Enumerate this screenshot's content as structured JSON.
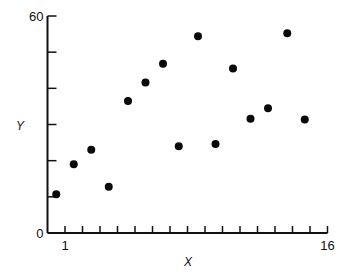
{
  "chart_data": {
    "type": "scatter",
    "title": "",
    "xlabel": "X",
    "ylabel": "Y",
    "xlim": [
      0,
      16
    ],
    "ylim": [
      0,
      60
    ],
    "x_tick_count": 16,
    "y_tick_step": 10,
    "x_tick_labels": [
      {
        "value": 1,
        "label": "1"
      },
      {
        "value": 16,
        "label": "16"
      }
    ],
    "y_tick_labels": [
      {
        "value": 0,
        "label": "0"
      },
      {
        "value": 60,
        "label": "60"
      }
    ],
    "grid": false,
    "legend": "none",
    "points": [
      {
        "x": 0.5,
        "y": 10.7
      },
      {
        "x": 1.5,
        "y": 19.0
      },
      {
        "x": 2.5,
        "y": 23.0
      },
      {
        "x": 3.5,
        "y": 12.8
      },
      {
        "x": 4.6,
        "y": 36.5
      },
      {
        "x": 5.6,
        "y": 41.6
      },
      {
        "x": 6.6,
        "y": 46.8
      },
      {
        "x": 7.5,
        "y": 24.0
      },
      {
        "x": 8.6,
        "y": 54.4
      },
      {
        "x": 9.6,
        "y": 24.6
      },
      {
        "x": 10.6,
        "y": 45.5
      },
      {
        "x": 11.6,
        "y": 31.6
      },
      {
        "x": 12.6,
        "y": 34.5
      },
      {
        "x": 13.7,
        "y": 55.2
      },
      {
        "x": 14.7,
        "y": 31.4
      }
    ]
  }
}
